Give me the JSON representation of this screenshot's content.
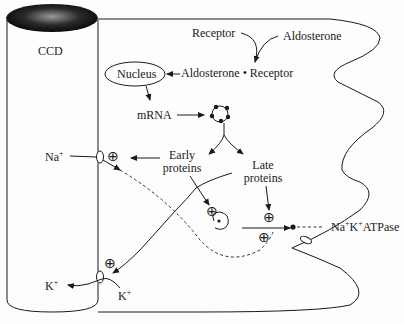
{
  "diagram": {
    "tubule_label": "CCD",
    "receptor": "Receptor",
    "aldosterone": "Aldosterone",
    "complex": "Aldosterone • Receptor",
    "nucleus": "Nucleus",
    "mrna": "mRNA",
    "early_proteins_line1": "Early",
    "early_proteins_line2": "proteins",
    "late_proteins_line1": "Late",
    "late_proteins_line2": "proteins",
    "na_ion": "Na",
    "k_ion_lumen": "K",
    "k_ion_cell": "K",
    "plus_sup": "+",
    "pump_label_na": "Na",
    "pump_label_k": "K",
    "pump_label_rest": "ATPase",
    "stimulation_symbol": "⊕",
    "colors": {
      "ink": "#1a1a1a",
      "tubule_cap_dark": "#111111",
      "tubule_cap_light": "#8a8a8a",
      "background": "#fdfdfd"
    }
  }
}
